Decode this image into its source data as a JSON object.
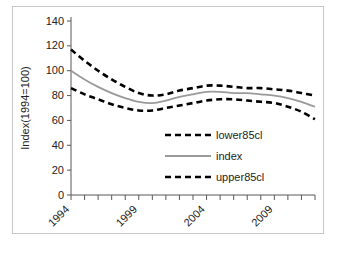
{
  "figure": {
    "caption": ""
  },
  "chart_data": {
    "type": "line",
    "title": "",
    "xlabel": "",
    "ylabel": "Index(1994=100)",
    "ylim": [
      0,
      140
    ],
    "ytick_step": 20,
    "yticks": [
      0,
      20,
      40,
      60,
      80,
      100,
      120,
      140
    ],
    "ytick_labels": [
      "0",
      "20",
      "40",
      "60",
      "80",
      "100",
      "120",
      "140"
    ],
    "xlim": [
      1994,
      2012
    ],
    "xticks": [
      1994,
      1995,
      1996,
      1997,
      1998,
      1999,
      2000,
      2001,
      2002,
      2003,
      2004,
      2005,
      2006,
      2007,
      2008,
      2009,
      2010,
      2011,
      2012
    ],
    "xtick_labels": [
      "1994",
      "",
      "",
      "",
      "",
      "1999",
      "",
      "",
      "",
      "",
      "2004",
      "",
      "",
      "",
      "",
      "2009",
      "",
      "",
      ""
    ],
    "xtick_label_rotation": -45,
    "grid": false,
    "legend_position": "inside-center-right",
    "x": [
      1994,
      1995,
      1996,
      1997,
      1998,
      1999,
      2000,
      2001,
      2002,
      2003,
      2004,
      2005,
      2006,
      2007,
      2008,
      2009,
      2010,
      2011,
      2012
    ],
    "series": [
      {
        "name": "lower85cl",
        "style": "dashed",
        "color": "#000000",
        "values": [
          117,
          108,
          100,
          93,
          87,
          82,
          80,
          81,
          84,
          86,
          88,
          88,
          87,
          86,
          86,
          85,
          84,
          82,
          80
        ]
      },
      {
        "name": "index",
        "style": "solid",
        "color": "#9a9a9a",
        "values": [
          100,
          93,
          87,
          82,
          78,
          75,
          74,
          76,
          79,
          81,
          83,
          83,
          82,
          82,
          81,
          80,
          78,
          75,
          71
        ]
      },
      {
        "name": "upper85cl",
        "style": "dashed",
        "color": "#000000",
        "values": [
          86,
          81,
          77,
          73,
          70,
          68,
          68,
          70,
          72,
          74,
          76,
          77,
          77,
          76,
          75,
          74,
          71,
          67,
          61
        ]
      }
    ],
    "legend": [
      {
        "label": "lower85cl",
        "style": "dashed",
        "color": "#000000"
      },
      {
        "label": "index",
        "style": "solid",
        "color": "#9a9a9a"
      },
      {
        "label": "upper85cl",
        "style": "dashed",
        "color": "#000000"
      }
    ]
  }
}
